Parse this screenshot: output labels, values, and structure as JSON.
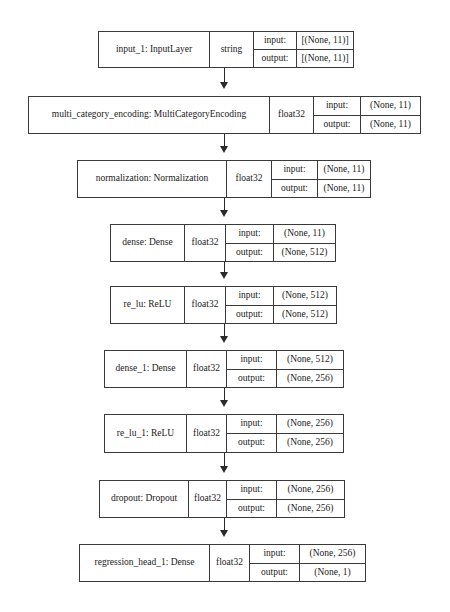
{
  "diagram": {
    "type": "keras-model-plot",
    "orientation": "vertical-top-to-bottom",
    "background_color": "#ffffff",
    "border_color": "#3a3a3a",
    "text_color": "#1a1a1a",
    "io_labels": {
      "input": "input:",
      "output": "output:"
    },
    "nodes": [
      {
        "id": "input_1",
        "name": "input_1: InputLayer",
        "dtype": "string",
        "input_shape": "[(None, 11)]",
        "output_shape": "[(None, 11)]"
      },
      {
        "id": "multi_category_encoding",
        "name": "multi_category_encoding: MultiCategoryEncoding",
        "dtype": "float32",
        "input_shape": "(None, 11)",
        "output_shape": "(None, 11)"
      },
      {
        "id": "normalization",
        "name": "normalization: Normalization",
        "dtype": "float32",
        "input_shape": "(None, 11)",
        "output_shape": "(None, 11)"
      },
      {
        "id": "dense",
        "name": "dense: Dense",
        "dtype": "float32",
        "input_shape": "(None, 11)",
        "output_shape": "(None, 512)"
      },
      {
        "id": "re_lu",
        "name": "re_lu: ReLU",
        "dtype": "float32",
        "input_shape": "(None, 512)",
        "output_shape": "(None, 512)"
      },
      {
        "id": "dense_1",
        "name": "dense_1: Dense",
        "dtype": "float32",
        "input_shape": "(None, 512)",
        "output_shape": "(None, 256)"
      },
      {
        "id": "re_lu_1",
        "name": "re_lu_1: ReLU",
        "dtype": "float32",
        "input_shape": "(None, 256)",
        "output_shape": "(None, 256)"
      },
      {
        "id": "dropout",
        "name": "dropout: Dropout",
        "dtype": "float32",
        "input_shape": "(None, 256)",
        "output_shape": "(None, 256)"
      },
      {
        "id": "regression_head_1",
        "name": "regression_head_1: Dense",
        "dtype": "float32",
        "input_shape": "(None, 256)",
        "output_shape": "(None, 1)"
      }
    ],
    "edges": [
      {
        "from": "input_1",
        "to": "multi_category_encoding"
      },
      {
        "from": "multi_category_encoding",
        "to": "normalization"
      },
      {
        "from": "normalization",
        "to": "dense"
      },
      {
        "from": "dense",
        "to": "re_lu"
      },
      {
        "from": "re_lu",
        "to": "dense_1"
      },
      {
        "from": "dense_1",
        "to": "re_lu_1"
      },
      {
        "from": "re_lu_1",
        "to": "dropout"
      },
      {
        "from": "dropout",
        "to": "regression_head_1"
      }
    ]
  },
  "layout": {
    "arrow_x": 224.5,
    "nodes": [
      {
        "left": 98,
        "top": 31,
        "width": 256,
        "height": 37,
        "name_w": 110,
        "dtype_w": 44,
        "label_w": 42
      },
      {
        "left": 28,
        "top": 96,
        "width": 393,
        "height": 38,
        "name_w": 240,
        "dtype_w": 44,
        "label_w": 46
      },
      {
        "left": 77,
        "top": 160,
        "width": 294,
        "height": 38,
        "name_w": 148,
        "dtype_w": 45,
        "label_w": 45
      },
      {
        "left": 110,
        "top": 224,
        "width": 226,
        "height": 38,
        "name_w": 73,
        "dtype_w": 41,
        "label_w": 47
      },
      {
        "left": 110,
        "top": 286,
        "width": 227,
        "height": 38,
        "name_w": 73,
        "dtype_w": 41,
        "label_w": 47
      },
      {
        "left": 104,
        "top": 350,
        "width": 240,
        "height": 38,
        "name_w": 81,
        "dtype_w": 40,
        "label_w": 49
      },
      {
        "left": 104,
        "top": 414,
        "width": 240,
        "height": 39,
        "name_w": 81,
        "dtype_w": 40,
        "label_w": 49
      },
      {
        "left": 99,
        "top": 480,
        "width": 246,
        "height": 38,
        "name_w": 88,
        "dtype_w": 38,
        "label_w": 49
      },
      {
        "left": 79,
        "top": 544,
        "width": 287,
        "height": 38,
        "name_w": 129,
        "dtype_w": 40,
        "label_w": 49
      }
    ],
    "edges": [
      {
        "top": 68,
        "height": 21
      },
      {
        "top": 134,
        "height": 19
      },
      {
        "top": 198,
        "height": 19
      },
      {
        "top": 262,
        "height": 17
      },
      {
        "top": 324,
        "height": 19
      },
      {
        "top": 388,
        "height": 19
      },
      {
        "top": 453,
        "height": 20
      },
      {
        "top": 518,
        "height": 19
      }
    ]
  }
}
